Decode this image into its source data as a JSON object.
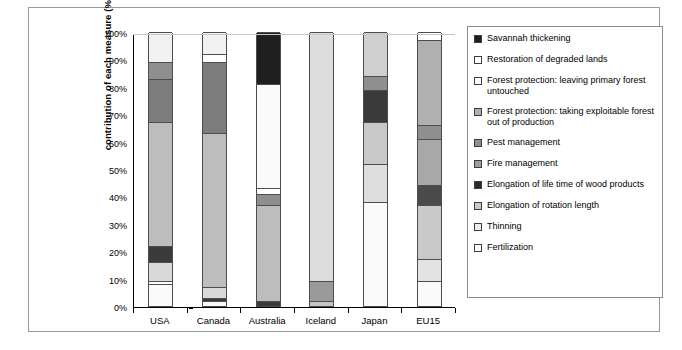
{
  "chart_data": {
    "type": "bar",
    "stacked": true,
    "orientation": "vertical",
    "title": "",
    "xlabel": "",
    "ylabel": "contribution of each measure (%)",
    "ylim": [
      0,
      100
    ],
    "ytick_labels": [
      "100%",
      "90%",
      "80%",
      "70%",
      "60%",
      "50%",
      "40%",
      "30%",
      "20%",
      "10%",
      "0%"
    ],
    "ytick_values": [
      100,
      90,
      80,
      70,
      60,
      50,
      40,
      30,
      20,
      10,
      0
    ],
    "grid": false,
    "legend_position": "right",
    "categories": [
      "USA",
      "Canada",
      "Australia",
      "Iceland",
      "Japan",
      "EU15"
    ],
    "series": [
      {
        "name": "Savannah thickening",
        "color": "#1f1f1f",
        "values": [
          0,
          0,
          19,
          0,
          0,
          0
        ]
      },
      {
        "name": "Restoration of degraded lands",
        "color": "#ffffff",
        "values": [
          0,
          0,
          0,
          0,
          0,
          3
        ]
      },
      {
        "name": "Forest protection: leaving primary forest untouched",
        "color": "#f2f2f2",
        "values": [
          11,
          8,
          0,
          0,
          16,
          0
        ]
      },
      {
        "name": "Forest protection: taking exploitable forest out of production",
        "color": "#a8a8a8",
        "values": [
          0,
          3,
          0,
          0,
          0,
          31
        ]
      },
      {
        "name": "Pest management",
        "color": "#8f8f8f",
        "values": [
          6,
          0,
          0,
          0,
          5,
          5
        ]
      },
      {
        "name": "Fire management",
        "color": "#7d7d7d",
        "values": [
          16,
          26,
          0,
          0,
          0,
          0
        ]
      },
      {
        "name": "Elongation of life time of wood products",
        "color": "#3a3a3a",
        "values": [
          0,
          0,
          0,
          0,
          12,
          0
        ]
      },
      {
        "name": "Elongation of rotation length",
        "color": "#bdbdbd",
        "values": [
          45,
          56,
          38,
          91,
          15,
          17
        ]
      },
      {
        "name": "Thinning",
        "color": "#d9d9d9",
        "values": [
          10,
          4,
          4,
          9,
          14,
          36
        ]
      },
      {
        "name": "Fertilization",
        "color": "#fafafa",
        "values": [
          12,
          3,
          39,
          0,
          38,
          8
        ]
      }
    ],
    "stacks": {
      "USA": [
        {
          "series": "Forest protection: leaving primary forest untouched",
          "from": 89,
          "to": 100,
          "color": "#f2f2f2"
        },
        {
          "series": "Pest management",
          "from": 83,
          "to": 89,
          "color": "#8f8f8f"
        },
        {
          "series": "Fire management",
          "from": 67,
          "to": 83,
          "color": "#7d7d7d"
        },
        {
          "series": "Elongation of rotation length",
          "from": 22,
          "to": 67,
          "color": "#bdbdbd"
        },
        {
          "series": "Elongation of life time of wood products",
          "from": 16,
          "to": 22,
          "color": "#3a3a3a"
        },
        {
          "series": "Thinning",
          "from": 9,
          "to": 16,
          "color": "#d9d9d9"
        },
        {
          "series": "Restoration of degraded lands",
          "from": 8,
          "to": 9,
          "color": "#ffffff"
        },
        {
          "series": "Fertilization",
          "from": 0,
          "to": 8,
          "color": "#fafafa"
        }
      ],
      "Canada": [
        {
          "series": "Forest protection: leaving primary forest untouched",
          "from": 92,
          "to": 100,
          "color": "#f2f2f2"
        },
        {
          "series": "Restoration of degraded lands",
          "from": 89,
          "to": 92,
          "color": "#ffffff"
        },
        {
          "series": "Fire management",
          "from": 63,
          "to": 89,
          "color": "#7d7d7d"
        },
        {
          "series": "Elongation of rotation length",
          "from": 7,
          "to": 63,
          "color": "#bdbdbd"
        },
        {
          "series": "Thinning",
          "from": 3,
          "to": 7,
          "color": "#d9d9d9"
        },
        {
          "series": "Elongation of life time of wood products",
          "from": 2,
          "to": 3,
          "color": "#3a3a3a"
        },
        {
          "series": "Fertilization",
          "from": 0,
          "to": 2,
          "color": "#fafafa"
        }
      ],
      "Australia": [
        {
          "series": "Savannah thickening",
          "from": 81,
          "to": 100,
          "color": "#1f1f1f"
        },
        {
          "series": "Fertilization",
          "from": 43,
          "to": 81,
          "color": "#fafafa"
        },
        {
          "series": "Restoration of degraded lands",
          "from": 41,
          "to": 43,
          "color": "#ffffff"
        },
        {
          "series": "Thinning",
          "from": 37,
          "to": 41,
          "color": "#8f8f8f"
        },
        {
          "series": "Elongation of rotation length",
          "from": 2,
          "to": 37,
          "color": "#bdbdbd"
        },
        {
          "series": "Elongation of life time of wood products",
          "from": 0,
          "to": 2,
          "color": "#3a3a3a"
        }
      ],
      "Iceland": [
        {
          "series": "Elongation of rotation length",
          "from": 9,
          "to": 100,
          "color": "#dcdcdc"
        },
        {
          "series": "Thinning",
          "from": 2,
          "to": 9,
          "color": "#9a9a9a"
        },
        {
          "series": "Fertilization",
          "from": 0,
          "to": 2,
          "color": "#c4c4c4"
        }
      ],
      "Japan": [
        {
          "series": "Forest protection: leaving primary forest untouched",
          "from": 84,
          "to": 100,
          "color": "#cfcfcf"
        },
        {
          "series": "Pest management",
          "from": 79,
          "to": 84,
          "color": "#8f8f8f"
        },
        {
          "series": "Elongation of life time of wood products",
          "from": 67,
          "to": 79,
          "color": "#3a3a3a"
        },
        {
          "series": "Elongation of rotation length",
          "from": 52,
          "to": 67,
          "color": "#c9c9c9"
        },
        {
          "series": "Thinning",
          "from": 38,
          "to": 52,
          "color": "#dedede"
        },
        {
          "series": "Fertilization",
          "from": 0,
          "to": 38,
          "color": "#fafafa"
        }
      ],
      "EU15": [
        {
          "series": "Restoration of degraded lands",
          "from": 97,
          "to": 100,
          "color": "#ffffff"
        },
        {
          "series": "Forest protection: taking exploitable forest out of production",
          "from": 66,
          "to": 97,
          "color": "#b0b0b0"
        },
        {
          "series": "Pest management",
          "from": 61,
          "to": 66,
          "color": "#8f8f8f"
        },
        {
          "series": "Fire management",
          "from": 44,
          "to": 61,
          "color": "#a8a8a8"
        },
        {
          "series": "Elongation of life time of wood products",
          "from": 37,
          "to": 44,
          "color": "#4a4a4a"
        },
        {
          "series": "Elongation of rotation length",
          "from": 17,
          "to": 37,
          "color": "#c9c9c9"
        },
        {
          "series": "Thinning",
          "from": 9,
          "to": 17,
          "color": "#e3e3e3"
        },
        {
          "series": "Fertilization",
          "from": 0,
          "to": 9,
          "color": "#fafafa"
        }
      ]
    }
  },
  "legend": {
    "items": [
      {
        "label": "Savannah thickening",
        "color": "#1f1f1f"
      },
      {
        "label": "Restoration of degraded lands",
        "color": "#ffffff"
      },
      {
        "label": "Forest protection: leaving primary forest untouched",
        "color": "#fbfbfb"
      },
      {
        "label": "Forest protection: taking exploitable forest out of production",
        "color": "#b0b0b0"
      },
      {
        "label": "Pest management",
        "color": "#8f8f8f"
      },
      {
        "label": "Fire management",
        "color": "#9e9e9e"
      },
      {
        "label": "Elongation of life time of wood products",
        "color": "#2b2b2b"
      },
      {
        "label": "Elongation of rotation length",
        "color": "#c9c9c9"
      },
      {
        "label": "Thinning",
        "color": "#ededed"
      },
      {
        "label": "Fertilization",
        "color": "#fdfdfd"
      }
    ]
  },
  "caption": {
    "text": ""
  }
}
